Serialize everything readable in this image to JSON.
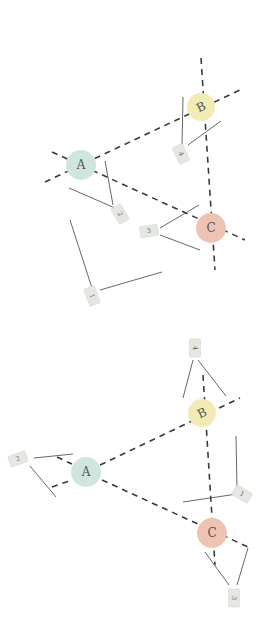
{
  "colors": {
    "node_A": "#cfe6e0",
    "node_B": "#f3ebb6",
    "node_C": "#efc3b3",
    "dash": "#3a3a3a",
    "leader": "#555555",
    "tag_fill": "#e4e8e0",
    "background": "#ffffff"
  },
  "diagrams": [
    {
      "name": "top-diagram",
      "nodes": [
        {
          "id": "A",
          "label": "A",
          "x": 81,
          "y": 165,
          "r": 15,
          "color": "#cfe6e0"
        },
        {
          "id": "B",
          "label": "B",
          "x": 201,
          "y": 107,
          "r": 14,
          "color": "#f3ebb6"
        },
        {
          "id": "C",
          "label": "C",
          "x": 211,
          "y": 228,
          "r": 15,
          "color": "#efc3b3"
        }
      ],
      "tags": [
        {
          "id": "1",
          "label": "1",
          "x": 92,
          "y": 296,
          "rot": 70
        },
        {
          "id": "2",
          "label": "2",
          "x": 120,
          "y": 214,
          "rot": 60
        },
        {
          "id": "3",
          "label": "3",
          "x": 149,
          "y": 231,
          "rot": -10
        },
        {
          "id": "4",
          "label": "4",
          "x": 181,
          "y": 154,
          "rot": 65
        }
      ]
    },
    {
      "name": "bottom-diagram",
      "nodes": [
        {
          "id": "A",
          "label": "A",
          "x": 86,
          "y": 472,
          "r": 15,
          "color": "#cfe6e0"
        },
        {
          "id": "B",
          "label": "B",
          "x": 202,
          "y": 413,
          "r": 14,
          "color": "#f3ebb6"
        },
        {
          "id": "C",
          "label": "C",
          "x": 212,
          "y": 533,
          "r": 15,
          "color": "#efc3b3"
        }
      ],
      "tags": [
        {
          "id": "4",
          "label": "4",
          "x": 195,
          "y": 348,
          "rot": 90
        },
        {
          "id": "2",
          "label": "2",
          "x": 18,
          "y": 459,
          "rot": -20
        },
        {
          "id": "1",
          "label": "1",
          "x": 242,
          "y": 494,
          "rot": 30
        },
        {
          "id": "3",
          "label": "3",
          "x": 234,
          "y": 598,
          "rot": 90
        }
      ]
    }
  ]
}
